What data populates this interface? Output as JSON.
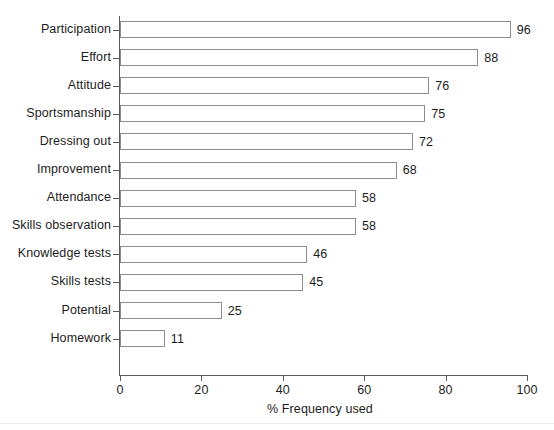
{
  "chart_data": {
    "type": "bar",
    "orientation": "horizontal",
    "title": "",
    "xlabel": "% Frequency used",
    "ylabel": "",
    "categories": [
      "Participation",
      "Effort",
      "Attitude",
      "Sportsmanship",
      "Dressing out",
      "Improvement",
      "Attendance",
      "Skills observation",
      "Knowledge tests",
      "Skills tests",
      "Potential",
      "Homework"
    ],
    "values": [
      96,
      88,
      76,
      75,
      72,
      68,
      58,
      58,
      46,
      45,
      25,
      11
    ],
    "value_labels": [
      "96",
      "88",
      "76",
      "75",
      "72",
      "68",
      "58",
      "58",
      "46",
      "45",
      "25",
      "11"
    ],
    "xlim": [
      0,
      100
    ],
    "xticks": [
      0,
      20,
      40,
      60,
      80,
      100
    ],
    "xtick_labels": [
      "0",
      "20",
      "40",
      "60",
      "80",
      "100"
    ],
    "grid": false,
    "legend": null,
    "bar_fill_color": "#ffffff",
    "bar_border_color": "#8d8d8d",
    "axis_color": "#5c5c5c",
    "text_color": "#1c1c1c",
    "background_color": "#ffffff"
  }
}
